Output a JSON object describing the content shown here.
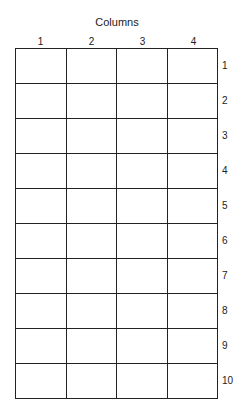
{
  "title": "Columns",
  "columns": [
    "1",
    "2",
    "3",
    "4"
  ],
  "rows": [
    "1",
    "2",
    "3",
    "4",
    "5",
    "6",
    "7",
    "8",
    "9",
    "10"
  ]
}
